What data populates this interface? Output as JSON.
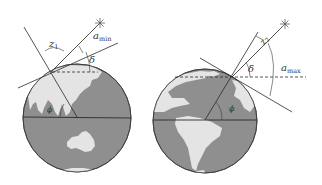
{
  "figure": {
    "colors": {
      "ocean": "#8f8f8f",
      "land": "#e4e4e4",
      "line": "#3a3a3a",
      "background": "#ffffff"
    },
    "left_globe": {
      "region": "Asia-Australia",
      "labels": {
        "zenith_angle": "z",
        "zenith_sub": "1",
        "altitude": "a",
        "altitude_sub": "min",
        "declination": "δ",
        "latitude": "ϕ"
      },
      "star_icon": "star-burst"
    },
    "right_globe": {
      "region": "Americas",
      "labels": {
        "zenith_angle": "z",
        "zenith_sub": "2",
        "altitude": "a",
        "altitude_sub": "max",
        "declination": "δ",
        "latitude": "ϕ"
      },
      "star_icon": "star-burst"
    }
  }
}
